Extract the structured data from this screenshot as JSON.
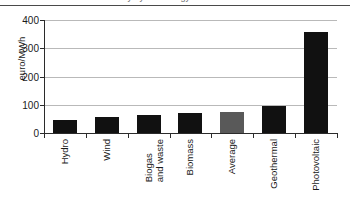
{
  "caption": {
    "text": "levelised cost of electricity by technology"
  },
  "chart_data": {
    "type": "bar",
    "title": "",
    "xlabel": "",
    "ylabel": "euro/MWh",
    "ylim": [
      0,
      400
    ],
    "yticks": [
      0,
      100,
      200,
      300,
      400
    ],
    "ytick_labels": [
      "0",
      "100",
      "200",
      "300",
      "400"
    ],
    "grid": true,
    "legend": "none",
    "categories": [
      "Hydro",
      "Biogas and waste",
      "Wind",
      "Biomass",
      "Average",
      "Geothermal",
      "Photovoltaic"
    ],
    "bars": [
      {
        "label": "Hydro",
        "label_lines": [
          "Hydro"
        ],
        "value": 46,
        "color": "#111111"
      },
      {
        "label": "Wind",
        "label_lines": [
          "Wind"
        ],
        "value": 55,
        "color": "#111111"
      },
      {
        "label": "Biogas and waste",
        "label_lines": [
          "Biogas",
          "and waste"
        ],
        "value": 65,
        "color": "#111111"
      },
      {
        "label": "Biomass",
        "label_lines": [
          "Biomass"
        ],
        "value": 72,
        "color": "#111111"
      },
      {
        "label": "Average",
        "label_lines": [
          "Average"
        ],
        "value": 76,
        "color": "#595959"
      },
      {
        "label": "Geothermal",
        "label_lines": [
          "Geothermal"
        ],
        "value": 95,
        "color": "#111111"
      },
      {
        "label": "Photovoltaic",
        "label_lines": [
          "Photovoltaic"
        ],
        "value": 357,
        "color": "#111111"
      }
    ],
    "values": [
      46,
      55,
      65,
      72,
      76,
      95,
      357
    ],
    "units": "euro/MWh"
  },
  "colors": {
    "bar_default": "#111111",
    "bar_highlight": "#595959",
    "gridline": "#b9b9b9",
    "axis": "#2b2b2b",
    "text": "#1a1a1a",
    "background": "#ffffff"
  }
}
